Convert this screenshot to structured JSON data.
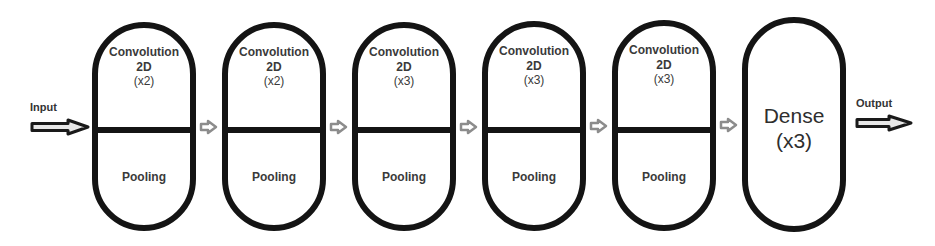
{
  "diagram": {
    "type": "cnn-architecture-pipeline",
    "input_label": "Input",
    "output_label": "Output",
    "blocks": [
      {
        "top": "Convolution",
        "mid": "2D",
        "count": "(x2)",
        "bottom": "Pooling"
      },
      {
        "top": "Convolution",
        "mid": "2D",
        "count": "(x2)",
        "bottom": "Pooling"
      },
      {
        "top": "Convolution",
        "mid": "2D",
        "count": "(x3)",
        "bottom": "Pooling"
      },
      {
        "top": "Convolution",
        "mid": "2D",
        "count": "(x3)",
        "bottom": "Pooling"
      },
      {
        "top": "Convolution",
        "mid": "2D",
        "count": "(x3)",
        "bottom": "Pooling"
      }
    ],
    "dense_block": {
      "label": "Dense",
      "count": "(x3)"
    },
    "colors": {
      "outline": "#141414",
      "connector_arrow": "#8c8c8c",
      "io_arrow": "#1a1a1a",
      "text": "#3a3a3a",
      "background": "#ffffff"
    }
  }
}
